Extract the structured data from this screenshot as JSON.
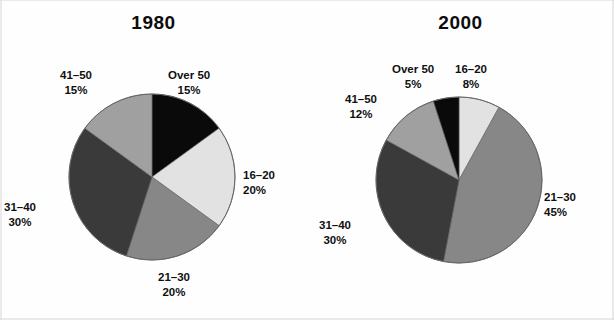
{
  "figure": {
    "width": 614,
    "height": 320,
    "background": "#fefefe",
    "text_color": "#111111"
  },
  "palette": {
    "over-50": "#0a0a0a",
    "16-20": "#e2e2e2",
    "21-30": "#878787",
    "31-40": "#3a3a3a",
    "41-50": "#a0a0a0",
    "outline": "#555555"
  },
  "charts": [
    {
      "id": "chart-1980",
      "title": "1980",
      "labels": {
        "over50": {
          "name": "Over 50",
          "pct": "15%"
        },
        "s1620": {
          "name": "16–20",
          "pct": "20%"
        },
        "s2130": {
          "name": "21–30",
          "pct": "20%"
        },
        "s3140": {
          "name": "31–40",
          "pct": "30%"
        },
        "s4150": {
          "name": "41–50",
          "pct": "15%"
        }
      }
    },
    {
      "id": "chart-2000",
      "title": "2000",
      "labels": {
        "over50": {
          "name": "Over 50",
          "pct": "5%"
        },
        "s1620": {
          "name": "16–20",
          "pct": "8%"
        },
        "s2130": {
          "name": "21–30",
          "pct": "45%"
        },
        "s3140": {
          "name": "31–40",
          "pct": "30%"
        },
        "s4150": {
          "name": "41–50",
          "pct": "12%"
        }
      }
    }
  ],
  "chart_data": [
    {
      "type": "pie",
      "title": "1980",
      "categories": [
        "Over 50",
        "16–20",
        "21–30",
        "31–40",
        "41–50"
      ],
      "values": [
        15,
        20,
        20,
        30,
        15
      ],
      "value_labels": [
        "15%",
        "20%",
        "20%",
        "30%",
        "15%"
      ],
      "units": "percent",
      "colors": [
        "#0a0a0a",
        "#e2e2e2",
        "#878787",
        "#3a3a3a",
        "#a0a0a0"
      ],
      "start_angle_deg": 0,
      "direction": "clockwise",
      "center": [
        152,
        177
      ],
      "radius": 83,
      "legend": "none",
      "labels_position": "outside",
      "xlabel": "",
      "ylabel": ""
    },
    {
      "type": "pie",
      "title": "2000",
      "categories": [
        "16–20",
        "21–30",
        "31–40",
        "41–50",
        "Over 50"
      ],
      "values": [
        8,
        45,
        30,
        12,
        5
      ],
      "value_labels": [
        "8%",
        "45%",
        "30%",
        "12%",
        "5%"
      ],
      "units": "percent",
      "colors": [
        "#e2e2e2",
        "#878787",
        "#3a3a3a",
        "#a0a0a0",
        "#0a0a0a"
      ],
      "start_angle_deg": 0,
      "direction": "clockwise",
      "center": [
        459,
        180
      ],
      "radius": 83,
      "legend": "none",
      "labels_position": "outside",
      "xlabel": "",
      "ylabel": ""
    }
  ]
}
